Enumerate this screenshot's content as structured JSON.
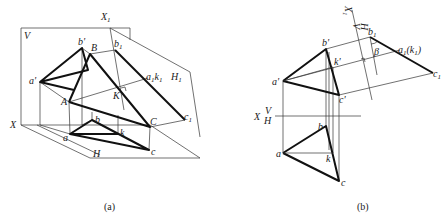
{
  "figure": {
    "panel_a": {
      "caption": "(a)",
      "labels": {
        "V": "V",
        "X1": "X",
        "X1_sub": "1",
        "H1": "H",
        "H1_sub": "1",
        "b_prime": "b'",
        "B": "B",
        "b1": "b",
        "b1_sub": "1",
        "a_prime": "a'",
        "a1k1": "a",
        "a1k1_sub1": "1",
        "a1k1_k": "k",
        "a1k1_sub2": "1",
        "K": "K",
        "A": "A",
        "X": "X",
        "C": "C",
        "c1": "c",
        "c1_sub": "1",
        "b": "b",
        "a": "a",
        "k": "k",
        "c": "c",
        "H": "H"
      }
    },
    "panel_b": {
      "caption": "(b)",
      "labels": {
        "X1": "X",
        "X1_sub": "1",
        "V_axis": "V",
        "H_axis": "H",
        "b_prime": "b'",
        "b1": "b",
        "b1_sub": "1",
        "beta": "β",
        "a1k1": "a",
        "a1k1_sub1": "1",
        "a1k1_k": "(k",
        "a1k1_sub2": "1",
        "a1k1_close": ")",
        "k_prime": "k'",
        "a_prime": "a'",
        "c_prime": "c'",
        "c1": "c",
        "c1_sub": "1",
        "X": "X",
        "V": "V",
        "H": "H",
        "b": "b",
        "a": "a",
        "k": "k",
        "c": "c"
      }
    }
  }
}
